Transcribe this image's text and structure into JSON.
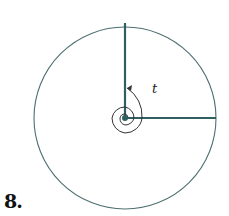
{
  "figure": {
    "problem_number": "8.",
    "angle_label": "t",
    "angle_revolutions": 2.25,
    "direction": "counterclockwise",
    "colors": {
      "radius": "#2f5f60",
      "circle": "#4f6f70",
      "spiral": "#333333",
      "text": "#111111"
    }
  }
}
